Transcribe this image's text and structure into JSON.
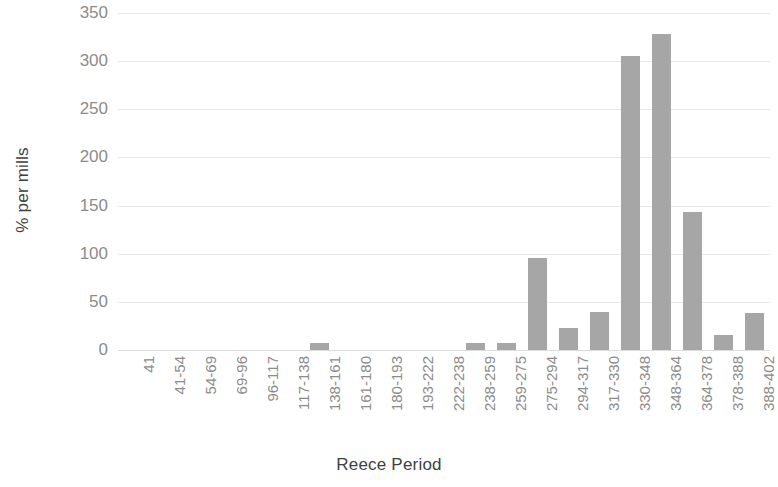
{
  "chart_data": {
    "type": "bar",
    "title": "",
    "xlabel": "Reece Period",
    "ylabel": "% per mills",
    "categories": [
      "41",
      "41-54",
      "54-69",
      "69-96",
      "96-117",
      "117-138",
      "138-161",
      "161-180",
      "180-193",
      "193-222",
      "222-238",
      "238-259",
      "259-275",
      "275-294",
      "294-317",
      "317-330",
      "330-348",
      "348-364",
      "364-378",
      "378-388",
      "388-402"
    ],
    "values": [
      0,
      0,
      0,
      0,
      0,
      0,
      7,
      0,
      0,
      0,
      0,
      7,
      7,
      96,
      23,
      40,
      305,
      328,
      143,
      16,
      38
    ],
    "ylim": [
      0,
      350
    ],
    "yticks": [
      0,
      50,
      100,
      150,
      200,
      250,
      300,
      350
    ],
    "ytick_labels": [
      "0",
      "50",
      "100",
      "150",
      "200",
      "250",
      "300",
      "350"
    ],
    "grid": true,
    "legend": false,
    "bar_color": "#a6a6a6",
    "gridline_color": "#e8e8e8",
    "tick_label_color": "#8c8c8c",
    "axis_title_color": "#3f3f3f",
    "background": "#ffffff"
  }
}
